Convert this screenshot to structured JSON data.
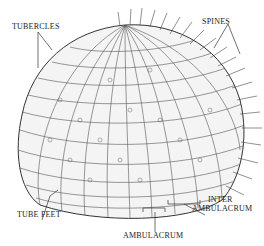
{
  "diagram": {
    "labels": {
      "tubercles": "TUBERCLES",
      "spines": "SPINES",
      "tube_feet": "TUBE FEET",
      "inter_ambulacrum_line1": "INTER",
      "inter_ambulacrum_line2": "AMBULACRUM",
      "ambulacrum": "AMBULACRUM"
    },
    "colors": {
      "ink": "#222222",
      "background": "#ffffff"
    }
  }
}
